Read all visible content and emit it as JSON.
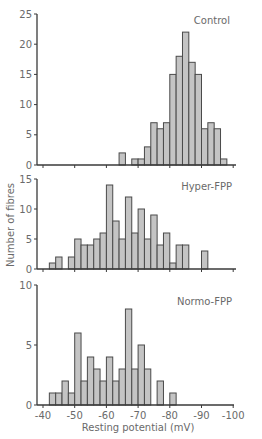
{
  "chart_data": {
    "type": "bar",
    "subtype": "histogram",
    "xlabel": "Resting potential (mV)",
    "ylabel": "Number of fibres",
    "xlim": [
      -40,
      -100
    ],
    "xticks": [
      -40,
      -50,
      -60,
      -70,
      -80,
      -90,
      -100
    ],
    "xtick_labels": [
      "-40",
      "-50",
      "-60",
      "-70",
      "-80",
      "-90",
      "-100"
    ],
    "bin_width_mV": 2,
    "grid": false,
    "panels": [
      {
        "name": "Control",
        "ylim": [
          0,
          25
        ],
        "yticks": [
          0,
          5,
          10,
          15,
          20,
          25
        ],
        "bins": [
          {
            "from": -64,
            "to": -66,
            "count": 2
          },
          {
            "from": -68,
            "to": -70,
            "count": 1
          },
          {
            "from": -70,
            "to": -72,
            "count": 1
          },
          {
            "from": -72,
            "to": -74,
            "count": 3
          },
          {
            "from": -74,
            "to": -76,
            "count": 7
          },
          {
            "from": -76,
            "to": -78,
            "count": 6
          },
          {
            "from": -78,
            "to": -80,
            "count": 7
          },
          {
            "from": -80,
            "to": -82,
            "count": 15
          },
          {
            "from": -82,
            "to": -84,
            "count": 18
          },
          {
            "from": -84,
            "to": -86,
            "count": 22
          },
          {
            "from": -86,
            "to": -88,
            "count": 17
          },
          {
            "from": -88,
            "to": -90,
            "count": 15
          },
          {
            "from": -90,
            "to": -92,
            "count": 6
          },
          {
            "from": -92,
            "to": -94,
            "count": 7
          },
          {
            "from": -94,
            "to": -96,
            "count": 6
          },
          {
            "from": -96,
            "to": -98,
            "count": 1
          }
        ]
      },
      {
        "name": "Hyper-FPP",
        "ylim": [
          0,
          15
        ],
        "yticks": [
          0,
          5,
          10,
          15
        ],
        "bins": [
          {
            "from": -42,
            "to": -44,
            "count": 1
          },
          {
            "from": -44,
            "to": -46,
            "count": 2
          },
          {
            "from": -48,
            "to": -50,
            "count": 2
          },
          {
            "from": -50,
            "to": -52,
            "count": 5
          },
          {
            "from": -52,
            "to": -54,
            "count": 4
          },
          {
            "from": -54,
            "to": -56,
            "count": 4
          },
          {
            "from": -56,
            "to": -58,
            "count": 5
          },
          {
            "from": -58,
            "to": -60,
            "count": 6
          },
          {
            "from": -60,
            "to": -62,
            "count": 14
          },
          {
            "from": -62,
            "to": -64,
            "count": 8
          },
          {
            "from": -64,
            "to": -66,
            "count": 5
          },
          {
            "from": -66,
            "to": -68,
            "count": 12
          },
          {
            "from": -68,
            "to": -70,
            "count": 6
          },
          {
            "from": -70,
            "to": -72,
            "count": 10
          },
          {
            "from": -72,
            "to": -74,
            "count": 5
          },
          {
            "from": -74,
            "to": -76,
            "count": 9
          },
          {
            "from": -76,
            "to": -78,
            "count": 4
          },
          {
            "from": -78,
            "to": -80,
            "count": 6
          },
          {
            "from": -80,
            "to": -82,
            "count": 1
          },
          {
            "from": -82,
            "to": -84,
            "count": 4
          },
          {
            "from": -84,
            "to": -86,
            "count": 4
          },
          {
            "from": -90,
            "to": -92,
            "count": 3
          }
        ]
      },
      {
        "name": "Normo-FPP",
        "ylim": [
          0,
          10
        ],
        "yticks": [
          0,
          5,
          10
        ],
        "bins": [
          {
            "from": -42,
            "to": -44,
            "count": 1
          },
          {
            "from": -44,
            "to": -46,
            "count": 1
          },
          {
            "from": -46,
            "to": -48,
            "count": 2
          },
          {
            "from": -48,
            "to": -50,
            "count": 1
          },
          {
            "from": -50,
            "to": -52,
            "count": 6
          },
          {
            "from": -52,
            "to": -54,
            "count": 2
          },
          {
            "from": -54,
            "to": -56,
            "count": 4
          },
          {
            "from": -56,
            "to": -58,
            "count": 3
          },
          {
            "from": -58,
            "to": -60,
            "count": 2
          },
          {
            "from": -60,
            "to": -62,
            "count": 4
          },
          {
            "from": -62,
            "to": -64,
            "count": 2
          },
          {
            "from": -64,
            "to": -66,
            "count": 3
          },
          {
            "from": -66,
            "to": -68,
            "count": 8
          },
          {
            "from": -68,
            "to": -70,
            "count": 3
          },
          {
            "from": -70,
            "to": -72,
            "count": 5
          },
          {
            "from": -72,
            "to": -74,
            "count": 3
          },
          {
            "from": -76,
            "to": -78,
            "count": 2
          },
          {
            "from": -80,
            "to": -82,
            "count": 1
          }
        ]
      }
    ]
  },
  "layout_px": {
    "x_at_minus40": 43,
    "px_per_mV": 3.17,
    "axis_x0": 37,
    "panels": [
      {
        "top": 14,
        "base": 165,
        "axis_right": 236,
        "label_x": 230,
        "label_y": 16
      },
      {
        "top": 179,
        "base": 269,
        "axis_right": 236,
        "label_x": 232,
        "label_y": 182
      },
      {
        "top": 285,
        "base": 405,
        "axis_right": 234,
        "label_x": 232,
        "label_y": 297
      }
    ],
    "xlabel_y": 431,
    "xticklabel_y": 419,
    "ylabel_x": 14,
    "ylabel_y": 225
  }
}
